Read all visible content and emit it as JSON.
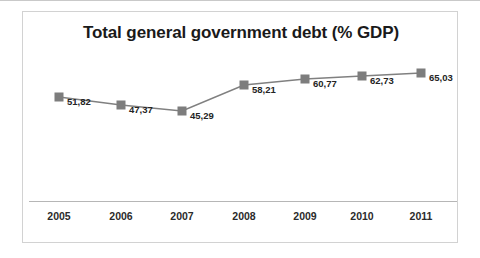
{
  "chart_data": {
    "type": "line",
    "title": "Total general government debt (% GDP)",
    "xlabel": "",
    "ylabel": "",
    "categories": [
      "2005",
      "2006",
      "2007",
      "2008",
      "2009",
      "2010",
      "2011"
    ],
    "values": [
      51.82,
      47.37,
      45.29,
      58.21,
      60.77,
      62.73,
      65.03
    ],
    "value_labels": [
      "51,82",
      "47,37",
      "45,29",
      "58,21",
      "60,77",
      "62,73",
      "65,03"
    ],
    "decimal_separator": ",",
    "series": [
      {
        "name": "Total general government debt (% GDP)",
        "values": [
          51.82,
          47.37,
          45.29,
          58.21,
          60.77,
          62.73,
          65.03
        ]
      }
    ],
    "ylim": [
      40,
      70
    ],
    "grid": false,
    "legend": "none",
    "marker": "square",
    "colors": {
      "line": "#808080",
      "marker": "#7d7d7d",
      "title": "#1a1a1a",
      "label": "#242424",
      "axis": "#b6b6b6",
      "frame": "#d2d2d2",
      "background": "#ffffff"
    },
    "points": [
      {
        "category": "2005",
        "value": 51.82,
        "label": "51,82",
        "x": 36,
        "y": 85
      },
      {
        "category": "2006",
        "value": 47.37,
        "label": "47,37",
        "x": 98,
        "y": 93
      },
      {
        "category": "2007",
        "value": 45.29,
        "label": "45,29",
        "x": 159,
        "y": 99
      },
      {
        "category": "2008",
        "value": 58.21,
        "label": "58,21",
        "x": 221,
        "y": 73
      },
      {
        "category": "2009",
        "value": 60.77,
        "label": "60,77",
        "x": 282,
        "y": 67
      },
      {
        "category": "2010",
        "value": 62.73,
        "label": "62,73",
        "x": 339,
        "y": 64
      },
      {
        "category": "2011",
        "value": 65.03,
        "label": "65,03",
        "x": 398,
        "y": 61
      }
    ]
  }
}
